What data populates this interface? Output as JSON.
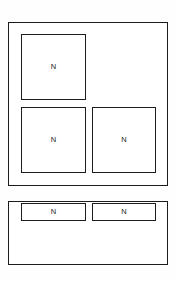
{
  "diagram": {
    "type": "block-layout-diagram",
    "canvas": {
      "width": 175,
      "height": 282,
      "background": "#fefefe"
    },
    "stroke_color": "#1c1c1c",
    "label_color": "#1a1a1a",
    "regions": [
      {
        "id": "upper-region",
        "name": "upper-region",
        "x": 8,
        "y": 22,
        "width": 160,
        "height": 164,
        "cells": [
          {
            "id": "upper-cell-1",
            "label": "N",
            "x": 12,
            "y": 11,
            "width": 65,
            "height": 66,
            "shape": "square"
          },
          {
            "id": "upper-cell-2",
            "label": "N",
            "x": 12,
            "y": 84,
            "width": 65,
            "height": 66,
            "shape": "square"
          },
          {
            "id": "upper-cell-3",
            "label": "N",
            "x": 83,
            "y": 84,
            "width": 64,
            "height": 66,
            "shape": "square"
          }
        ]
      },
      {
        "id": "lower-region",
        "name": "lower-region",
        "x": 8,
        "y": 201,
        "width": 160,
        "height": 64,
        "cells": [
          {
            "id": "lower-cell-1",
            "label": "N",
            "x": 12,
            "y": 1,
            "width": 65,
            "height": 18,
            "shape": "wide"
          },
          {
            "id": "lower-cell-2",
            "label": "N",
            "x": 83,
            "y": 1,
            "width": 64,
            "height": 18,
            "shape": "wide"
          }
        ]
      }
    ]
  }
}
